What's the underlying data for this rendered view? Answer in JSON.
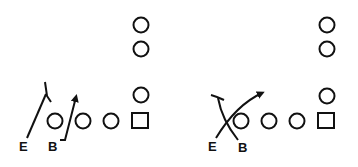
{
  "diagrams": [
    {
      "name": "play-left",
      "labels": {
        "end": "E",
        "back": "B"
      },
      "description": "End blocks inside, back runs outside of end"
    },
    {
      "name": "play-right",
      "labels": {
        "end": "E",
        "back": "B"
      },
      "description": "End and back cross (X block)"
    }
  ],
  "colors": {
    "ink": "#111111",
    "background": "#ffffff"
  }
}
